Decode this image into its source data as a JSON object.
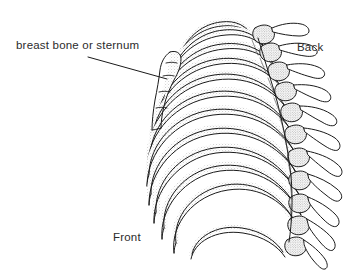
{
  "figure": {
    "view": "three-quarter oblique view of the thoracic cage",
    "background_color": "#ffffff",
    "ink_color": "#1a1a1a",
    "shading_color": "#8a8a8a",
    "style": "pen-and-ink line drawing with stipple shading"
  },
  "labels": {
    "sternum": "breast bone or sternum",
    "back": "Back",
    "front": "Front"
  },
  "leader_line": {
    "from_x": 88,
    "from_y": 57,
    "to_x": 167,
    "to_y": 79
  },
  "anatomy": {
    "rib_count": 12,
    "vertebra_count": 12,
    "parts": [
      "sternum",
      "costal cartilage",
      "ribs",
      "thoracic vertebrae",
      "transverse processes",
      "floating rib"
    ]
  }
}
